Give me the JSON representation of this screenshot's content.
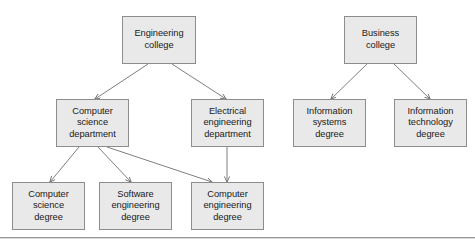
{
  "diagram": {
    "type": "tree-diagram",
    "colors": {
      "node_fill": "#e9e9e9",
      "node_border": "#8d8d8d",
      "edge": "#6f6f6f",
      "text": "#1a1a1a",
      "rule": "#9a9a9a",
      "background": "#ffffff"
    },
    "nodes": [
      {
        "id": "engineering-college",
        "label": "Engineering\ncollege",
        "x": 122,
        "y": 16,
        "w": 74,
        "h": 48
      },
      {
        "id": "computer-science-department",
        "label": "Computer\nscience\ndepartment",
        "x": 56,
        "y": 99,
        "w": 73,
        "h": 48
      },
      {
        "id": "electrical-engineering-department",
        "label": "Electrical\nengineering\ndepartment",
        "x": 191,
        "y": 99,
        "w": 73,
        "h": 48
      },
      {
        "id": "computer-science-degree",
        "label": "Computer\nscience\ndegree",
        "x": 12,
        "y": 182,
        "w": 73,
        "h": 48
      },
      {
        "id": "software-engineering-degree",
        "label": "Software\nengineering\ndegree",
        "x": 99,
        "y": 182,
        "w": 73,
        "h": 48
      },
      {
        "id": "computer-engineering-degree",
        "label": "Computer\nengineering\ndegree",
        "x": 191,
        "y": 182,
        "w": 73,
        "h": 48
      },
      {
        "id": "business-college",
        "label": "Business\ncollege",
        "x": 344,
        "y": 16,
        "w": 73,
        "h": 48
      },
      {
        "id": "information-systems-degree",
        "label": "Information\nsystems\ndegree",
        "x": 293,
        "y": 99,
        "w": 73,
        "h": 48
      },
      {
        "id": "information-technology-degree",
        "label": "Information\ntechnology\ndegree",
        "x": 394,
        "y": 99,
        "w": 73,
        "h": 48
      }
    ],
    "edges": [
      {
        "id": "edge-eng-to-cs-dept",
        "from": "engineering-college",
        "to": "computer-science-department",
        "x1": 148,
        "y1": 64,
        "x2": 95,
        "y2": 99
      },
      {
        "id": "edge-eng-to-ee-dept",
        "from": "engineering-college",
        "to": "electrical-engineering-department",
        "x1": 172,
        "y1": 64,
        "x2": 226,
        "y2": 99
      },
      {
        "id": "edge-cs-to-cs-degree",
        "from": "computer-science-department",
        "to": "computer-science-degree",
        "x1": 79,
        "y1": 147,
        "x2": 50,
        "y2": 182
      },
      {
        "id": "edge-cs-to-se-degree",
        "from": "computer-science-department",
        "to": "software-engineering-degree",
        "x1": 98,
        "y1": 147,
        "x2": 131,
        "y2": 182
      },
      {
        "id": "edge-cs-to-ce-degree",
        "from": "computer-science-department",
        "to": "computer-engineering-degree",
        "x1": 107,
        "y1": 147,
        "x2": 212,
        "y2": 182
      },
      {
        "id": "edge-ee-to-ce-degree",
        "from": "electrical-engineering-department",
        "to": "computer-engineering-degree",
        "x1": 227,
        "y1": 147,
        "x2": 227,
        "y2": 182
      },
      {
        "id": "edge-bus-to-is-degree",
        "from": "business-college",
        "to": "information-systems-degree",
        "x1": 367,
        "y1": 64,
        "x2": 331,
        "y2": 99
      },
      {
        "id": "edge-bus-to-it-degree",
        "from": "business-college",
        "to": "information-technology-degree",
        "x1": 394,
        "y1": 64,
        "x2": 430,
        "y2": 99
      }
    ],
    "footer_rule": {
      "y": 237
    }
  }
}
